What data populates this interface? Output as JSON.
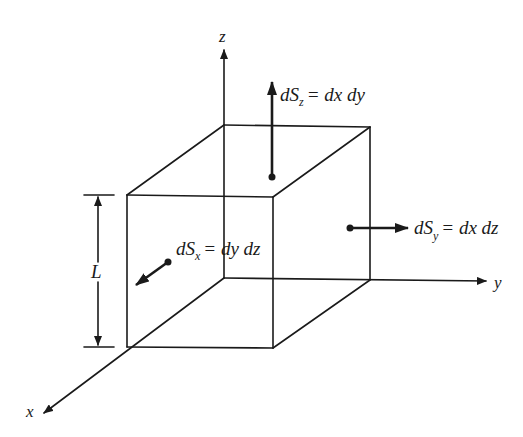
{
  "figure": {
    "type": "diagram",
    "colors": {
      "ink": "#1a1a1a",
      "background": "#ffffff"
    }
  },
  "axes": {
    "x": {
      "label": "x"
    },
    "y": {
      "label": "y"
    },
    "z": {
      "label": "z"
    }
  },
  "dimension": {
    "label": "L"
  },
  "surface_elements": [
    {
      "id": "dSz",
      "symbol": "dS",
      "subscript": "z",
      "equals": "= dx dy",
      "direction": "+z"
    },
    {
      "id": "dSy",
      "symbol": "dS",
      "subscript": "y",
      "equals": "= dx dz",
      "direction": "+y"
    },
    {
      "id": "dSx",
      "symbol": "dS",
      "subscript": "x",
      "equals": "= dy dz",
      "direction": "+x"
    }
  ]
}
